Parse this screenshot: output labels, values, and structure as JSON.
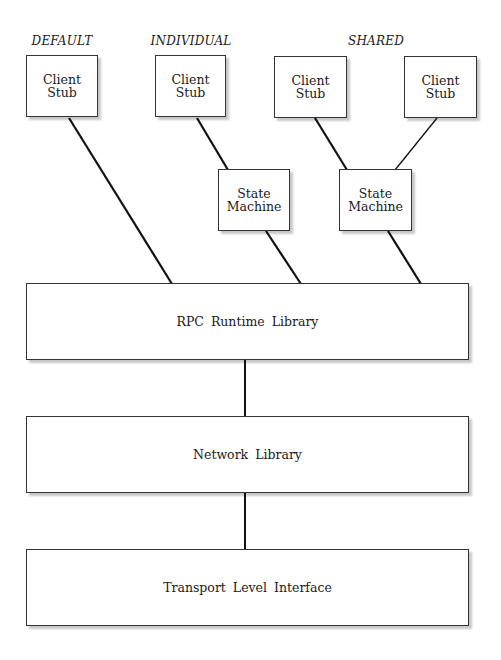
{
  "diagram": {
    "group_labels": {
      "default": "DEFAULT",
      "individual": "INDIVIDUAL",
      "shared": "SHARED"
    },
    "client_stubs": [
      {
        "id": "stub-default",
        "label": "Client\nStub",
        "group": "DEFAULT"
      },
      {
        "id": "stub-individual",
        "label": "Client\nStub",
        "group": "INDIVIDUAL"
      },
      {
        "id": "stub-shared-1",
        "label": "Client\nStub",
        "group": "SHARED"
      },
      {
        "id": "stub-shared-2",
        "label": "Client\nStub",
        "group": "SHARED"
      }
    ],
    "state_machines": [
      {
        "id": "sm-individual",
        "label": "State\nMachine",
        "group": "INDIVIDUAL"
      },
      {
        "id": "sm-shared",
        "label": "State\nMachine",
        "group": "SHARED"
      }
    ],
    "layers": [
      {
        "id": "rpc-runtime",
        "label": "RPC Runtime Library"
      },
      {
        "id": "network-library",
        "label": "Network Library"
      },
      {
        "id": "transport-level-interface",
        "label": "Transport Level Interface"
      }
    ],
    "connections": [
      {
        "from": "stub-default",
        "to": "rpc-runtime"
      },
      {
        "from": "stub-individual",
        "to": "sm-individual"
      },
      {
        "from": "sm-individual",
        "to": "rpc-runtime"
      },
      {
        "from": "stub-shared-1",
        "to": "sm-shared"
      },
      {
        "from": "stub-shared-2",
        "to": "sm-shared"
      },
      {
        "from": "sm-shared",
        "to": "rpc-runtime"
      },
      {
        "from": "rpc-runtime",
        "to": "network-library"
      },
      {
        "from": "network-library",
        "to": "transport-level-interface"
      }
    ],
    "colors": {
      "line": "#111111",
      "box_border": "#333333",
      "background": "#ffffff"
    }
  }
}
